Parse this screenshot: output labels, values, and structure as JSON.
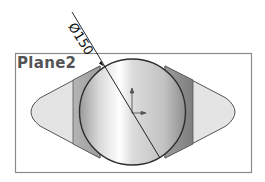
{
  "plane": {
    "label": "Plane2"
  },
  "dimension": {
    "text": "Ø150",
    "symbol": "diameter",
    "value": "150"
  },
  "sketch": {
    "shape": "circle",
    "origin_marker": "origin-axes-icon"
  },
  "colors": {
    "frame": "#8a8a8a",
    "lobe_fill": "#e2e2e2",
    "band_fill": "#a8a8a8",
    "outline": "#333333",
    "label": "#555555"
  }
}
